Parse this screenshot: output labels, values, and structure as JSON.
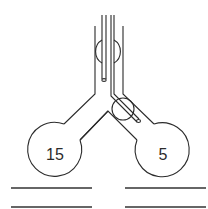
{
  "diagram": {
    "type": "Y-shaped tube apparatus with two bulbs and a diverter rod",
    "bulbs": [
      {
        "id": "left",
        "label": "15"
      },
      {
        "id": "right",
        "label": "5"
      }
    ],
    "answer_lines": {
      "left": 2,
      "right": 2
    },
    "colors": {
      "line": "#2b2b2b",
      "background": "#ffffff"
    }
  }
}
